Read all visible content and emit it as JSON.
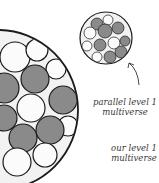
{
  "labels": {
    "parallel": {
      "line1": "parallel level 1",
      "line2": "multiverse"
    },
    "ours": {
      "line1": "our level 1",
      "line2": "multiverse"
    }
  },
  "colors": {
    "gray_fill": "#8a8a8a",
    "white_fill": "#fbfbfb",
    "stroke": "#1a1a1a",
    "text": "#3a3a3a"
  },
  "diagram": {
    "large_multiverse": {
      "name": "our level 1 multiverse",
      "outer": {
        "cx": -2,
        "cy": 110,
        "r": 80
      },
      "bubbles": [
        {
          "cx": 15,
          "cy": 57,
          "r": 15,
          "fill": "white"
        },
        {
          "cx": 37,
          "cy": 50,
          "r": 11,
          "fill": "white"
        },
        {
          "cx": 56,
          "cy": 69,
          "r": 10,
          "fill": "white"
        },
        {
          "cx": 35,
          "cy": 79,
          "r": 14,
          "fill": "gray"
        },
        {
          "cx": 4,
          "cy": 88,
          "r": 15,
          "fill": "gray"
        },
        {
          "cx": 63,
          "cy": 100,
          "r": 14,
          "fill": "gray"
        },
        {
          "cx": 31,
          "cy": 108,
          "r": 14,
          "fill": "white"
        },
        {
          "cx": 4,
          "cy": 118,
          "r": 13,
          "fill": "gray"
        },
        {
          "cx": 68,
          "cy": 126,
          "r": 10,
          "fill": "white"
        },
        {
          "cx": 50,
          "cy": 130,
          "r": 14,
          "fill": "gray"
        },
        {
          "cx": 23,
          "cy": 138,
          "r": 14,
          "fill": "gray"
        },
        {
          "cx": 45,
          "cy": 155,
          "r": 12,
          "fill": "white"
        },
        {
          "cx": 17,
          "cy": 162,
          "r": 14,
          "fill": "white"
        }
      ]
    },
    "small_multiverse": {
      "name": "parallel level 1 multiverse",
      "outer": {
        "cx": 106,
        "cy": 38,
        "r": 26
      },
      "bubbles": [
        {
          "cx": 108,
          "cy": 20,
          "r": 5,
          "fill": "white"
        },
        {
          "cx": 97,
          "cy": 24,
          "r": 6,
          "fill": "gray"
        },
        {
          "cx": 118,
          "cy": 28,
          "r": 6,
          "fill": "gray"
        },
        {
          "cx": 90,
          "cy": 33,
          "r": 6,
          "fill": "white"
        },
        {
          "cx": 105,
          "cy": 31,
          "r": 7,
          "fill": "gray"
        },
        {
          "cx": 114,
          "cy": 43,
          "r": 6,
          "fill": "white"
        },
        {
          "cx": 125,
          "cy": 41,
          "r": 5,
          "fill": "gray"
        },
        {
          "cx": 100,
          "cy": 45,
          "r": 6,
          "fill": "gray"
        },
        {
          "cx": 87,
          "cy": 46,
          "r": 5,
          "fill": "white"
        },
        {
          "cx": 121,
          "cy": 52,
          "r": 6,
          "fill": "gray"
        },
        {
          "cx": 97,
          "cy": 57,
          "r": 5,
          "fill": "white"
        },
        {
          "cx": 110,
          "cy": 57,
          "r": 6,
          "fill": "gray"
        }
      ]
    },
    "arrow": {
      "from": [
        139,
        85
      ],
      "to": [
        129,
        63
      ],
      "target": "small_multiverse"
    }
  }
}
